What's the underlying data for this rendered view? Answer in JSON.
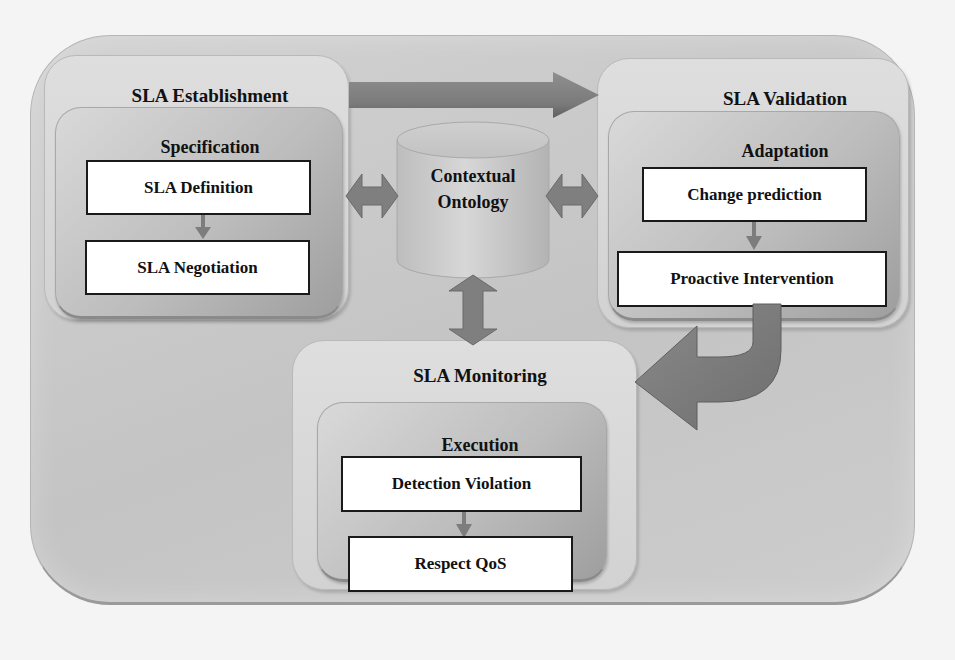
{
  "diagram": {
    "colors": {
      "background": "#f4f4f4",
      "outer_container": "#c8c8c8",
      "stage_fill": "#d8d8d8",
      "phase_fill": "#b8b8b8",
      "arrow": "#7d7d7d",
      "box_border": "#1a1a1a",
      "box_fill": "#ffffff"
    },
    "center": {
      "shape": "cylinder",
      "line1": "Contextual",
      "line2": "Ontology"
    },
    "stages": [
      {
        "id": "establishment",
        "title": "SLA Establishment",
        "phase": "Specification",
        "steps": [
          "SLA Definition",
          "SLA Negotiation"
        ]
      },
      {
        "id": "validation",
        "title": "SLA Validation",
        "phase": "Adaptation",
        "steps": [
          "Change prediction",
          "Proactive Intervention"
        ]
      },
      {
        "id": "monitoring",
        "title": "SLA Monitoring",
        "phase": "Execution",
        "steps": [
          "Detection Violation",
          "Respect QoS"
        ]
      }
    ],
    "edges": [
      {
        "from": "SLA Establishment",
        "to": "SLA Validation",
        "type": "straight-arrow"
      },
      {
        "from": "SLA Validation",
        "to": "SLA Monitoring",
        "type": "curved-arrow"
      },
      {
        "from": "Contextual Ontology",
        "to": "SLA Establishment",
        "type": "bidirectional"
      },
      {
        "from": "Contextual Ontology",
        "to": "SLA Validation",
        "type": "bidirectional"
      },
      {
        "from": "Contextual Ontology",
        "to": "SLA Monitoring",
        "type": "bidirectional"
      },
      {
        "from": "SLA Definition",
        "to": "SLA Negotiation",
        "type": "small-arrow"
      },
      {
        "from": "Change prediction",
        "to": "Proactive Intervention",
        "type": "small-arrow"
      },
      {
        "from": "Detection Violation",
        "to": "Respect QoS",
        "type": "small-arrow"
      }
    ]
  }
}
